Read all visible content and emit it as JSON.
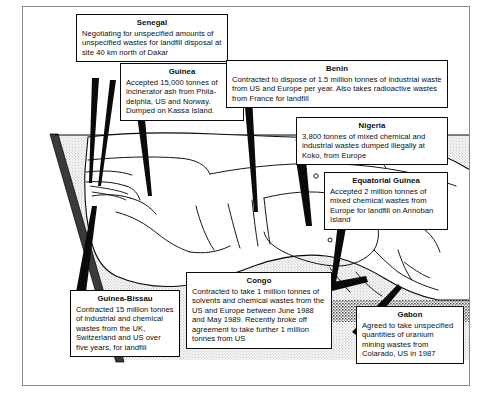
{
  "figure": {
    "region_label": "West Africa"
  },
  "callouts": [
    {
      "id": "senegal",
      "country": "Senegal",
      "text": "Negotiating for unspecified amounts of unspecified wastes for landfill disposal at site 40 km north of Dakar"
    },
    {
      "id": "guinea",
      "country": "Guinea",
      "text": "Accepted 15,000 tonnes of incinerator ash from Phila-delphia, US and Norway. Dumped on Kassa Island."
    },
    {
      "id": "benin",
      "country": "Benin",
      "text": "Contracted to dispose of 1.5 million tonnes of industrial waste from US and Europe per year. Also takes radioactive wastes from France for landfill"
    },
    {
      "id": "nigeria",
      "country": "Nigeria",
      "text": "3,800 tonnes of mixed chemical and industrial wastes dumped illegally at Koko, from Europe"
    },
    {
      "id": "equatorial-guinea",
      "country": "Equatorial Guinea",
      "text": "Accepted 2 million tonnes of mixed chemical wastes from Europe for landfill on Annoban Island"
    },
    {
      "id": "guinea-bissau",
      "country": "Guinea-Bissau",
      "text": "Contracted 15 million tonnes of industrial and chemical wastes from the UK, Switzerland and US over five years, for landfill"
    },
    {
      "id": "congo",
      "country": "Congo",
      "text": "Contracted to take 1 million tonnes of solvents and chemical wastes from the US and Europe between June 1988 and May 1989. Recently broke off agreement to take further 1 million tonnes from US"
    },
    {
      "id": "gabon",
      "country": "Gabon",
      "text": "Agreed to take unspecified quantities of uranium mining wastes from Colarado, US in 1987"
    }
  ],
  "colors": {
    "ink": "#0a0a0a",
    "paper": "#ffffff",
    "frame": "#8d8d8d",
    "ocean_stipple": "#c9c9c9",
    "land": "#ffffff"
  }
}
